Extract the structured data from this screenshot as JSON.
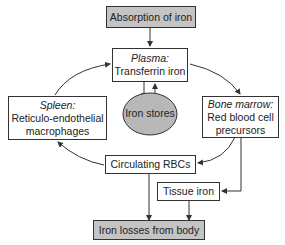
{
  "nodes": {
    "absorption": {
      "label": "Absorption of iron"
    },
    "plasma": {
      "title": "Plasma:",
      "label": "Transferrin iron"
    },
    "spleen": {
      "title": "Spleen:",
      "line1": "Reticulo-endothelial",
      "line2": "macrophages"
    },
    "stores": {
      "label": "Iron stores"
    },
    "marrow": {
      "title": "Bone marrow:",
      "line1": "Red blood cell",
      "line2": "precursors"
    },
    "rbcs": {
      "label": "Circulating RBCs"
    },
    "tissue": {
      "label": "Tissue iron"
    },
    "losses": {
      "label": "Iron losses from body"
    }
  },
  "colors": {
    "highlight": "#c4c4c4",
    "stroke": "#333333"
  }
}
